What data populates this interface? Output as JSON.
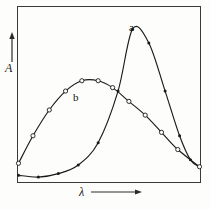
{
  "figure": {
    "background_color": "#fdfdfc",
    "frame_color": "#3a3a3a",
    "curve_color": "#1a1a1a"
  },
  "axes": {
    "y_label": "A",
    "y_label_name": "absorbance",
    "y_arrow_icon": "up-arrow-icon",
    "x_label": "λ",
    "x_label_name": "wavelength",
    "x_arrow_icon": "right-arrow-icon",
    "ticks_shown": "none",
    "tick_labels": []
  },
  "chart_data": {
    "type": "line",
    "title": "",
    "subtitle": "",
    "xlabel": "λ",
    "ylabel": "A",
    "xlim": [
      0,
      100
    ],
    "ylim": [
      0,
      100
    ],
    "grid": false,
    "legend_position": "inline-curve-labels",
    "annotations": [
      {
        "text": "a",
        "x": 63,
        "y": 93,
        "target_series": "a"
      },
      {
        "text": "b",
        "x": 33,
        "y": 55,
        "target_series": "b"
      }
    ],
    "series": [
      {
        "name": "a",
        "label": "a",
        "marker": "dot",
        "marker_filled": true,
        "x": [
          0,
          11,
          22,
          33,
          44,
          55,
          63,
          72,
          81,
          89,
          95,
          100
        ],
        "y": [
          3,
          2,
          4,
          9,
          22,
          52,
          88,
          80,
          52,
          26,
          12,
          8
        ]
      },
      {
        "name": "b",
        "label": "b",
        "marker": "circle",
        "marker_filled": false,
        "x": [
          0,
          8,
          17,
          26,
          35,
          44,
          52,
          61,
          70,
          79,
          88,
          100
        ],
        "y": [
          10,
          26,
          41,
          52,
          58,
          58,
          54,
          46,
          38,
          28,
          18,
          8
        ]
      }
    ]
  }
}
